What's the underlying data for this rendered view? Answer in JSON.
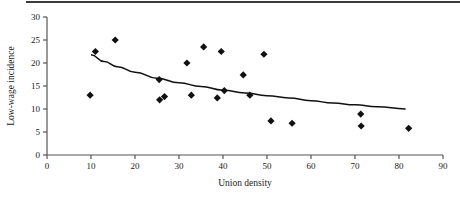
{
  "chart_data": {
    "type": "scatter",
    "title": "",
    "xlabel": "Union density",
    "ylabel": "Low-wage incidence",
    "xlim": [
      0,
      90
    ],
    "ylim": [
      0,
      30
    ],
    "xticks": [
      0,
      10,
      20,
      30,
      40,
      50,
      60,
      70,
      80,
      90
    ],
    "yticks": [
      0,
      5,
      10,
      15,
      20,
      25,
      30
    ],
    "grid": false,
    "legend": "none",
    "marker": "diamond",
    "marker_color": "#111111",
    "points": [
      {
        "x": 9.8,
        "y": 13.0
      },
      {
        "x": 11.0,
        "y": 22.5
      },
      {
        "x": 15.5,
        "y": 25.0
      },
      {
        "x": 25.5,
        "y": 16.4
      },
      {
        "x": 25.6,
        "y": 12.0
      },
      {
        "x": 26.7,
        "y": 12.7
      },
      {
        "x": 31.8,
        "y": 20.0
      },
      {
        "x": 32.8,
        "y": 13.0
      },
      {
        "x": 35.6,
        "y": 23.5
      },
      {
        "x": 38.7,
        "y": 12.4
      },
      {
        "x": 39.6,
        "y": 22.5
      },
      {
        "x": 40.3,
        "y": 14.0
      },
      {
        "x": 44.6,
        "y": 17.4
      },
      {
        "x": 46.1,
        "y": 13.0
      },
      {
        "x": 49.3,
        "y": 21.9
      },
      {
        "x": 50.9,
        "y": 7.4
      },
      {
        "x": 55.7,
        "y": 6.9
      },
      {
        "x": 71.3,
        "y": 8.9
      },
      {
        "x": 71.4,
        "y": 6.3
      },
      {
        "x": 82.2,
        "y": 5.8
      }
    ],
    "trend_line": {
      "type": "fitted-curve",
      "color": "#111111",
      "x_start": 10.0,
      "x_end": 81.5,
      "y_start": 21.8,
      "y_end": 10.0,
      "points": [
        {
          "x": 10.0,
          "y": 21.8
        },
        {
          "x": 13.0,
          "y": 20.3
        },
        {
          "x": 16.0,
          "y": 19.2
        },
        {
          "x": 20.0,
          "y": 18.0
        },
        {
          "x": 25.0,
          "y": 16.7
        },
        {
          "x": 30.0,
          "y": 15.7
        },
        {
          "x": 35.0,
          "y": 14.9
        },
        {
          "x": 40.0,
          "y": 14.1
        },
        {
          "x": 45.0,
          "y": 13.5
        },
        {
          "x": 50.0,
          "y": 12.9
        },
        {
          "x": 55.0,
          "y": 12.4
        },
        {
          "x": 60.0,
          "y": 11.8
        },
        {
          "x": 65.0,
          "y": 11.3
        },
        {
          "x": 70.0,
          "y": 10.9
        },
        {
          "x": 75.0,
          "y": 10.5
        },
        {
          "x": 81.5,
          "y": 10.0
        }
      ]
    }
  },
  "axes": {
    "x_title": "Union density",
    "y_title": "Low-wage incidence",
    "x_tick_labels": [
      "0",
      "10",
      "20",
      "30",
      "40",
      "50",
      "60",
      "70",
      "80",
      "90"
    ],
    "y_tick_labels": [
      "0",
      "5",
      "10",
      "15",
      "20",
      "25",
      "30"
    ]
  },
  "style": {
    "axis_color": "#555555",
    "rule_color": "#3b3b3b",
    "text_color": "#1a1a1a"
  }
}
